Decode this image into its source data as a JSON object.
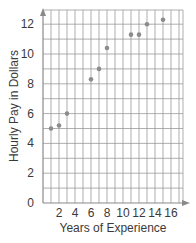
{
  "chart_data": {
    "type": "scatter",
    "title": "",
    "xlabel": "Years of Experience",
    "ylabel": "Hourly Pay in Dollars",
    "xlim": [
      0,
      17.5
    ],
    "ylim": [
      0,
      12.9
    ],
    "grid": true,
    "x_ticks": [
      2,
      4,
      6,
      8,
      10,
      12,
      14,
      16
    ],
    "y_ticks": [
      0,
      2,
      4,
      6,
      8,
      10,
      12
    ],
    "series": [
      {
        "name": "Hourly Pay",
        "points": [
          {
            "x": 1,
            "y": 5.0
          },
          {
            "x": 2,
            "y": 5.2
          },
          {
            "x": 3,
            "y": 6.0
          },
          {
            "x": 6,
            "y": 8.3
          },
          {
            "x": 7,
            "y": 9.0
          },
          {
            "x": 8,
            "y": 10.4
          },
          {
            "x": 11,
            "y": 11.3
          },
          {
            "x": 12,
            "y": 11.3
          },
          {
            "x": 13,
            "y": 12.0
          },
          {
            "x": 15,
            "y": 12.3
          }
        ]
      }
    ]
  },
  "colors": {
    "grid": "#9a9a9a",
    "axis": "#8a8a8a",
    "point": "#8c8c8c",
    "text": "#3a3a3a"
  }
}
